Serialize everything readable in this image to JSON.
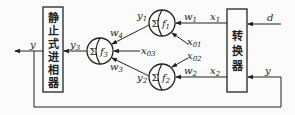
{
  "diagram": {
    "blocks": {
      "compensator": {
        "label_chars": [
          "静",
          "止",
          "式",
          "进",
          "相",
          "器"
        ],
        "label": "静止式进相器"
      },
      "converter": {
        "label_chars": [
          "转",
          "换",
          "器"
        ],
        "label": "转换器"
      }
    },
    "neurons": [
      {
        "id": "f1",
        "sum_symbol": "Σ",
        "func": "f",
        "func_sub": "1",
        "output": "y",
        "output_sub": "1"
      },
      {
        "id": "f2",
        "sum_symbol": "Σ",
        "func": "f",
        "func_sub": "2",
        "output": "y",
        "output_sub": "2"
      },
      {
        "id": "f3",
        "sum_symbol": "Σ",
        "func": "f",
        "func_sub": "3",
        "output": "y",
        "output_sub": "3"
      }
    ],
    "signals": {
      "d": "d",
      "y_out": "y",
      "y_feedback": "y",
      "x1": {
        "base": "x",
        "sub": "1"
      },
      "x2": {
        "base": "x",
        "sub": "2"
      },
      "x01": {
        "base": "x",
        "sub": "01"
      },
      "x02": {
        "base": "x",
        "sub": "02"
      },
      "x03": {
        "base": "x",
        "sub": "03"
      },
      "w1": {
        "base": "w",
        "sub": "1"
      },
      "w2": {
        "base": "w",
        "sub": "2"
      },
      "w3": {
        "base": "w",
        "sub": "3"
      },
      "w4": {
        "base": "w",
        "sub": "4"
      }
    }
  }
}
